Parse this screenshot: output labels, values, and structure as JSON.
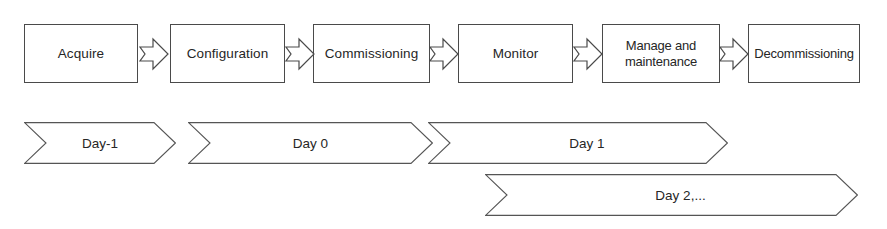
{
  "diagram": {
    "background_color": "#ffffff",
    "line_color": "#4a4a4a",
    "text_color": "#262626",
    "lifecycle": {
      "name": "lifecycle-stage-row",
      "stages": [
        {
          "id": "acquire",
          "label": "Acquire",
          "x": 24,
          "y": 24,
          "width": 114,
          "height": 59
        },
        {
          "id": "configuration",
          "label": "Configuration",
          "x": 170,
          "y": 24,
          "width": 115,
          "height": 59
        },
        {
          "id": "commissioning",
          "label": "Commissioning",
          "x": 313,
          "y": 24,
          "width": 117,
          "height": 59
        },
        {
          "id": "monitor",
          "label": "Monitor",
          "x": 458,
          "y": 24,
          "width": 115,
          "height": 59
        },
        {
          "id": "manage-and-maintenance",
          "label": "Manage and\nmaintenance",
          "x": 602,
          "y": 24,
          "width": 118,
          "height": 59
        },
        {
          "id": "decommissioning",
          "label": "Decommissioning",
          "x": 748,
          "y": 24,
          "width": 112,
          "height": 59
        }
      ],
      "connectors": [
        {
          "id": "acquire-to-configuration",
          "x": 139,
          "y": 37
        },
        {
          "id": "configuration-to-commissioning",
          "x": 285,
          "y": 37
        },
        {
          "id": "commissioning-to-monitor",
          "x": 429,
          "y": 37
        },
        {
          "id": "monitor-to-manage",
          "x": 573,
          "y": 37
        },
        {
          "id": "manage-to-decommissioning",
          "x": 719,
          "y": 37
        }
      ]
    },
    "phases": {
      "name": "day-phase-band",
      "items": [
        {
          "id": "day-minus-1",
          "label": "Day-1",
          "x": 24,
          "y": 122,
          "width": 152,
          "height": 42,
          "notch": 22,
          "offset_label": false
        },
        {
          "id": "day-0",
          "label": "Day 0",
          "x": 188,
          "y": 122,
          "width": 245,
          "height": 42,
          "notch": 22,
          "offset_label": false
        },
        {
          "id": "day-1",
          "label": "Day 1",
          "x": 428,
          "y": 122,
          "width": 300,
          "height": 42,
          "notch": 22,
          "offset_label": true
        },
        {
          "id": "day-2-plus",
          "label": "Day 2,...",
          "x": 485,
          "y": 174,
          "width": 373,
          "height": 42,
          "notch": 22,
          "offset_label": true
        }
      ]
    }
  }
}
